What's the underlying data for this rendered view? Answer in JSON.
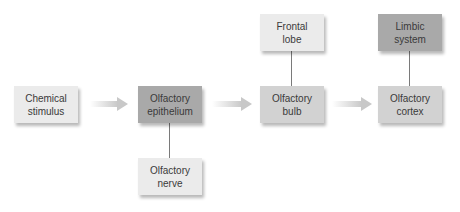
{
  "diagram": {
    "nodes": [
      {
        "id": "chemical-stimulus",
        "label": "Chemical\nstimulus"
      },
      {
        "id": "olfactory-epithelium",
        "label": "Olfactory\nepithelium"
      },
      {
        "id": "olfactory-nerve",
        "label": "Olfactory\nnerve"
      },
      {
        "id": "frontal-lobe",
        "label": "Frontal\nlobe"
      },
      {
        "id": "olfactory-bulb",
        "label": "Olfactory\nbulb"
      },
      {
        "id": "limbic-system",
        "label": "Limbic\nsystem"
      },
      {
        "id": "olfactory-cortex",
        "label": "Olfactory\ncortex"
      }
    ],
    "edges": [
      {
        "from": "chemical-stimulus",
        "to": "olfactory-epithelium",
        "type": "arrow"
      },
      {
        "from": "olfactory-epithelium",
        "to": "olfactory-bulb",
        "type": "arrow"
      },
      {
        "from": "olfactory-bulb",
        "to": "olfactory-cortex",
        "type": "arrow"
      },
      {
        "from": "olfactory-epithelium",
        "to": "olfactory-nerve",
        "type": "line"
      },
      {
        "from": "olfactory-bulb",
        "to": "frontal-lobe",
        "type": "line"
      },
      {
        "from": "olfactory-cortex",
        "to": "limbic-system",
        "type": "line"
      }
    ],
    "colors": {
      "light_box": "#ebebeb",
      "mid_box": "#d2d2d2",
      "dark_box": "#a9a9a9",
      "arrow": "#cfcfcf",
      "connector": "#7a7a7a"
    }
  }
}
